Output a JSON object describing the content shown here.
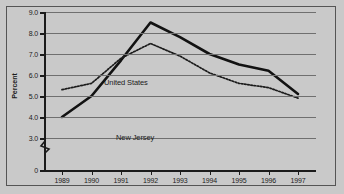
{
  "figure": {
    "background_color": "#c9c9c9",
    "frame_color": "#555555",
    "axis_color": "#1b1b1b",
    "grid_color": "#6f6f6f"
  },
  "axes": {
    "y_title": "Percent",
    "y_ticks": [
      "9.0",
      "8.0",
      "7.0",
      "6.0",
      "5.0",
      "4.0",
      "3.0",
      "0"
    ],
    "x_ticks": [
      "1989",
      "1990",
      "1991",
      "1992",
      "1993",
      "1994",
      "1995",
      "1996",
      "1997"
    ],
    "axis_break": "zigzag-break-icon"
  },
  "annotations": {
    "united_states": "United States",
    "new_jersey": "New Jersey"
  },
  "chart_data": {
    "type": "line",
    "title": "",
    "xlabel": "",
    "ylabel": "Percent",
    "x": [
      1989,
      1990,
      1991,
      1992,
      1993,
      1994,
      1995,
      1996,
      1997
    ],
    "categories": [
      "1989",
      "1990",
      "1991",
      "1992",
      "1993",
      "1994",
      "1995",
      "1996",
      "1997"
    ],
    "series": [
      {
        "name": "New Jersey",
        "style": "solid",
        "color": "#121212",
        "line_width": 2.6,
        "values": [
          4.0,
          5.0,
          6.7,
          8.5,
          7.8,
          7.0,
          6.5,
          6.2,
          5.1
        ]
      },
      {
        "name": "United States",
        "style": "dotted",
        "color": "#1b1b1b",
        "line_width": 1.6,
        "values": [
          5.3,
          5.6,
          6.8,
          7.5,
          6.9,
          6.1,
          5.6,
          5.4,
          4.9
        ]
      }
    ],
    "ylim": [
      3.0,
      9.0
    ],
    "y_axis_has_break": true,
    "y_break_from": 0,
    "y_break_to": 3.0,
    "grid": "horizontal",
    "legend": "inline-labels"
  }
}
